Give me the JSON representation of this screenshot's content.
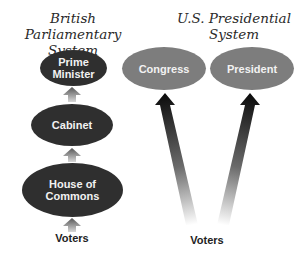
{
  "british": {
    "title_line1": "British Parliamentary",
    "title_line2": "System",
    "nodes": [
      {
        "line1": "Prime",
        "line2": "Minister"
      },
      {
        "line1": "Cabinet"
      },
      {
        "line1": "House of",
        "line2": "Commons"
      }
    ],
    "voters_label": "Voters"
  },
  "us": {
    "title_line1": "U.S. Presidential",
    "title_line2": "System",
    "nodes": [
      {
        "line1": "Congress"
      },
      {
        "line1": "President"
      }
    ],
    "voters_label": "Voters"
  },
  "colors": {
    "british_node": "#2f2f2f",
    "us_node": "#7d7d7d",
    "arrow_dark": "#111111",
    "node_text": "#f2f2f2"
  }
}
